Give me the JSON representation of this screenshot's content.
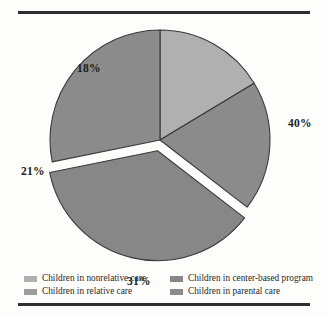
{
  "chart_data": {
    "type": "pie",
    "title": "",
    "subtitle": "",
    "xlabel": "",
    "ylabel": "",
    "grid": false,
    "legend_position": "bottom",
    "total": 110,
    "labels": [
      "Children in nonrelative care",
      "Children in relative care",
      "Children in center-based program",
      "Children in parental care"
    ],
    "values": [
      18,
      21,
      40,
      31
    ],
    "data_labels": [
      "18%",
      "21%",
      "40%",
      "31%"
    ],
    "colors": [
      "#b0b0b0",
      "#8b8b8b",
      "#878787",
      "#8b8b8b"
    ],
    "exploded_slice": "Children in center-based program",
    "slices": [
      {
        "label": "Children in nonrelative care",
        "value": 18,
        "data_label": "18%",
        "color": "#b0b0b0",
        "exploded": false
      },
      {
        "label": "Children in relative care",
        "value": 21,
        "data_label": "21%",
        "color": "#8b8b8b",
        "exploded": false
      },
      {
        "label": "Children in center-based program",
        "value": 40,
        "data_label": "40%",
        "color": "#878787",
        "exploded": true
      },
      {
        "label": "Children in parental care",
        "value": 31,
        "data_label": "31%",
        "color": "#8b8b8b",
        "exploded": false
      }
    ]
  },
  "legend": {
    "items": [
      {
        "label": "Children in nonrelative care",
        "color": "#b0b0b0"
      },
      {
        "label": "Children in relative care",
        "color": "#9d9d9d"
      },
      {
        "label": "Children in center-based program",
        "color": "#878787"
      },
      {
        "label": "Children in parental care",
        "color": "#8b8b8b"
      }
    ]
  },
  "style": {
    "rule_color": "#2f2f31",
    "outline_color": "#3a3a3a",
    "background": "#fdfdfc"
  }
}
